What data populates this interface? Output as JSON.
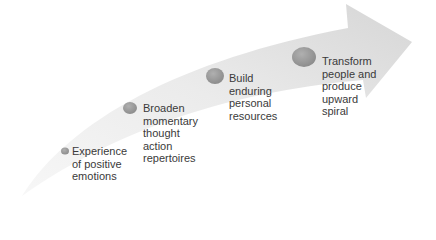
{
  "diagram": {
    "type": "curved-arrow-process",
    "arrow_color_light": "#f2f2f2",
    "arrow_color_dark": "#d9d9d9",
    "dot_color": "#9a9a9a",
    "steps": [
      {
        "label": "Experience\nof positive\nemotions"
      },
      {
        "label": "Broaden\nmomentary\nthought\naction\nrepertoires"
      },
      {
        "label": "Build\nenduring\npersonal\nresources"
      },
      {
        "label": "Transform\npeople and\nproduce\nupward\nspiral"
      }
    ]
  }
}
